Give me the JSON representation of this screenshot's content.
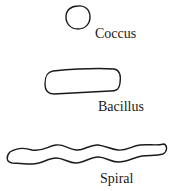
{
  "shapes": [
    {
      "name": "coccus",
      "label": "Coccus",
      "form": "circle"
    },
    {
      "name": "bacillus",
      "label": "Bacillus",
      "form": "rod"
    },
    {
      "name": "spiral",
      "label": "Spiral",
      "form": "wavy-rod"
    }
  ],
  "colors": {
    "stroke": "#1a1a1a",
    "background": "#ffffff"
  }
}
